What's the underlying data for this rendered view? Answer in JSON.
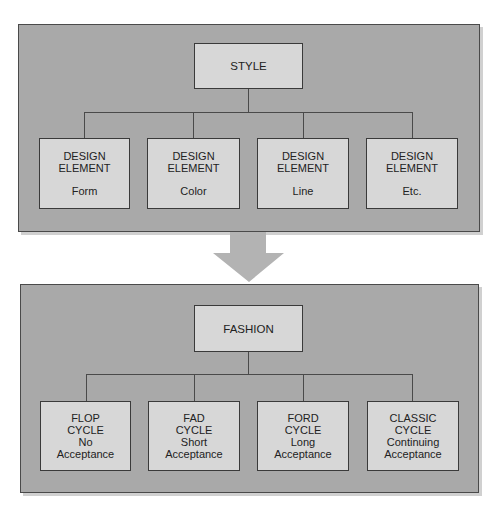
{
  "style_panel": {
    "root": {
      "label": "STYLE"
    },
    "children": [
      {
        "line1": "DESIGN",
        "line2": "ELEMENT",
        "detail": "Form"
      },
      {
        "line1": "DESIGN",
        "line2": "ELEMENT",
        "detail": "Color"
      },
      {
        "line1": "DESIGN",
        "line2": "ELEMENT",
        "detail": "Line"
      },
      {
        "line1": "DESIGN",
        "line2": "ELEMENT",
        "detail": "Etc."
      }
    ]
  },
  "arrow": {
    "direction": "down",
    "color": "#b3b3b3"
  },
  "fashion_panel": {
    "root": {
      "label": "FASHION"
    },
    "children": [
      {
        "line1": "FLOP",
        "line2": "CYCLE",
        "line3": "No",
        "line4": "Acceptance"
      },
      {
        "line1": "FAD",
        "line2": "CYCLE",
        "line3": "Short",
        "line4": "Acceptance"
      },
      {
        "line1": "FORD",
        "line2": "CYCLE",
        "line3": "Long",
        "line4": "Acceptance"
      },
      {
        "line1": "CLASSIC",
        "line2": "CYCLE",
        "line3": "Continuing",
        "line4": "Acceptance"
      }
    ]
  },
  "colors": {
    "panel_fill": "#a9a9a9",
    "box_fill": "#d7d7d7",
    "border": "#3a3a3a"
  }
}
